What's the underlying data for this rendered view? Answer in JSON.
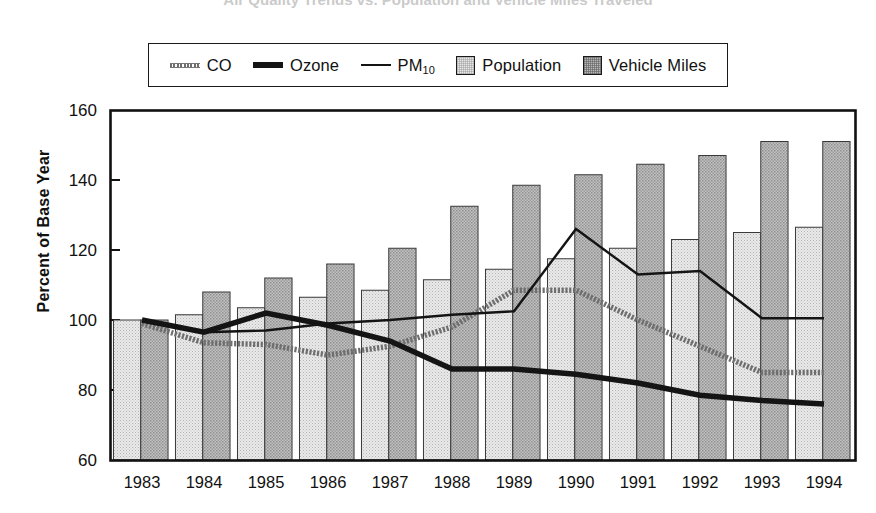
{
  "title": "Air Quality Trends vs. Population and Vehicle Miles Traveled",
  "axis": {
    "ylabel": "Percent of Base Year",
    "yticks": [
      "160",
      "140",
      "120",
      "100",
      "80",
      "60"
    ],
    "xticks": [
      "1983",
      "1984",
      "1985",
      "1986",
      "1987",
      "1988",
      "1989",
      "1990",
      "1991",
      "1992",
      "1993",
      "1994"
    ]
  },
  "legend": {
    "items": [
      {
        "label": "CO",
        "sub": "",
        "marker": "dotted-gray-line-swatch",
        "color": "#6e6e6e"
      },
      {
        "label": "Ozone",
        "sub": "",
        "marker": "thick-black-line-swatch",
        "color": "#141414"
      },
      {
        "label": "PM",
        "sub": "10",
        "marker": "thin-black-line-swatch",
        "color": "#141414"
      },
      {
        "label": "Population",
        "sub": "",
        "marker": "light-gray-box-swatch",
        "color": "#e6e6e6"
      },
      {
        "label": "Vehicle Miles",
        "sub": "",
        "marker": "dark-gray-box-swatch",
        "color": "#b9b9b9"
      }
    ]
  },
  "chart_data": {
    "type": "bar",
    "title": "Air Quality Trends vs. Population and Vehicle Miles Traveled",
    "xlabel": "",
    "ylabel": "Percent of Base Year",
    "ylim": [
      60,
      160
    ],
    "ytick_values": [
      60,
      80,
      100,
      120,
      140,
      160
    ],
    "grid": false,
    "legend_position": "top",
    "categories": [
      "1983",
      "1984",
      "1985",
      "1986",
      "1987",
      "1988",
      "1989",
      "1990",
      "1991",
      "1992",
      "1993",
      "1994"
    ],
    "bar_series": [
      {
        "name": "Population",
        "type": "bar",
        "color": "#e6e6e6",
        "values": [
          100,
          101.5,
          103.5,
          106.5,
          108.5,
          111.5,
          114.5,
          117.5,
          120.5,
          123,
          125,
          126.5
        ]
      },
      {
        "name": "Vehicle Miles",
        "type": "bar",
        "color": "#b9b9b9",
        "values": [
          100,
          108,
          112,
          116,
          120.5,
          132.5,
          138.5,
          141.5,
          144.5,
          147,
          151,
          151
        ]
      }
    ],
    "line_series": [
      {
        "name": "CO",
        "type": "line",
        "color": "#6e6e6e",
        "style": "dotted-thick",
        "values": [
          99,
          93.5,
          93,
          90,
          92.5,
          98,
          108.5,
          108.5,
          100,
          92.5,
          85,
          85
        ]
      },
      {
        "name": "Ozone",
        "type": "line",
        "color": "#141414",
        "style": "thick-solid",
        "values": [
          100,
          96.5,
          102,
          98.5,
          94,
          86,
          86,
          84.5,
          82,
          78.5,
          77,
          76
        ]
      },
      {
        "name": "PM10",
        "type": "line",
        "color": "#141414",
        "style": "thin-solid",
        "values": [
          100,
          96.5,
          97,
          99,
          100,
          101.5,
          102.5,
          126,
          113,
          114,
          100.5,
          100.5
        ]
      }
    ]
  }
}
